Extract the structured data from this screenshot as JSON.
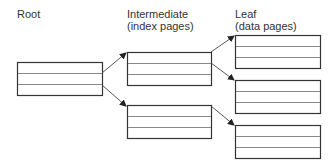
{
  "labels": {
    "root": "Root",
    "intermediate_line1": "Intermediate",
    "intermediate_line2": "(index pages)",
    "leaf_line1": "Leaf",
    "leaf_line2": "(data pages)"
  },
  "nodes": {
    "root": {
      "x": 17,
      "y": 62,
      "w": 85,
      "h": 33,
      "rows": 3
    },
    "intermediate": [
      {
        "x": 127,
        "y": 52,
        "w": 84,
        "h": 33,
        "rows": 3
      },
      {
        "x": 127,
        "y": 105,
        "w": 84,
        "h": 33,
        "rows": 3
      }
    ],
    "leaf": [
      {
        "x": 235,
        "y": 35,
        "w": 85,
        "h": 33,
        "rows": 3
      },
      {
        "x": 235,
        "y": 80,
        "w": 85,
        "h": 33,
        "rows": 3
      },
      {
        "x": 235,
        "y": 125,
        "w": 85,
        "h": 33,
        "rows": 3
      }
    ]
  },
  "colors": {
    "border": "#333333",
    "divider": "#888888",
    "text": "#333333"
  }
}
